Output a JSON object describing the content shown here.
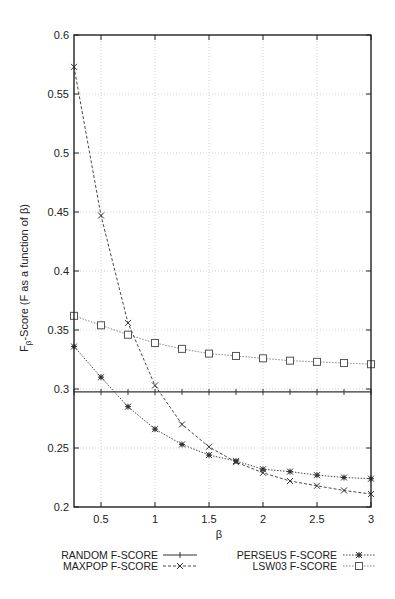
{
  "chart_data": {
    "type": "line",
    "title": "",
    "xlabel": "β",
    "ylabel": "Fβ-Score (F as a function of β)",
    "xlim": [
      0.25,
      3
    ],
    "ylim": [
      0.2,
      0.6
    ],
    "x_ticks": [
      "0.5",
      "1",
      "1.5",
      "2",
      "2.5",
      "3"
    ],
    "y_ticks": [
      "0.2",
      "0.25",
      "0.3",
      "0.35",
      "0.4",
      "0.45",
      "0.5",
      "0.55",
      "0.6"
    ],
    "grid": true,
    "legend_position": "below",
    "x": [
      0.25,
      0.5,
      0.75,
      1.0,
      1.25,
      1.5,
      1.75,
      2.0,
      2.25,
      2.5,
      2.75,
      3.0
    ],
    "series": [
      {
        "name": "RANDOM F-SCORE",
        "style": "solid",
        "marker": "plus",
        "values": [
          0.2975,
          0.2975,
          0.2975,
          0.2975,
          0.2975,
          0.2975,
          0.2975,
          0.2975,
          0.2975,
          0.2975,
          0.2975,
          0.2975
        ]
      },
      {
        "name": "MAXPOP F-SCORE",
        "style": "dashed",
        "marker": "x",
        "values": [
          0.573,
          0.447,
          0.356,
          0.303,
          0.27,
          0.251,
          0.238,
          0.229,
          0.222,
          0.218,
          0.214,
          0.211
        ]
      },
      {
        "name": "PERSEUS F-SCORE",
        "style": "dotted",
        "marker": "star",
        "values": [
          0.336,
          0.31,
          0.285,
          0.266,
          0.253,
          0.244,
          0.239,
          0.232,
          0.23,
          0.227,
          0.225,
          0.224
        ]
      },
      {
        "name": "LSW03 F-SCORE",
        "style": "dotted",
        "marker": "square",
        "values": [
          0.362,
          0.354,
          0.346,
          0.339,
          0.334,
          0.33,
          0.328,
          0.326,
          0.324,
          0.323,
          0.322,
          0.321
        ]
      }
    ]
  },
  "legend": {
    "random": "RANDOM  F-SCORE",
    "maxpop": "MAXPOP  F-SCORE",
    "perseus": "PERSEUS F-SCORE",
    "lsw03": "LSW03  F-SCORE"
  },
  "axes": {
    "xlabel": "β",
    "ylabel_main": "F",
    "ylabel_sub": "β",
    "ylabel_rest": "-Score (F as a function of β)"
  },
  "colors": {
    "line": "#333333",
    "grid": "#c8c8c8",
    "frame": "#222222"
  }
}
